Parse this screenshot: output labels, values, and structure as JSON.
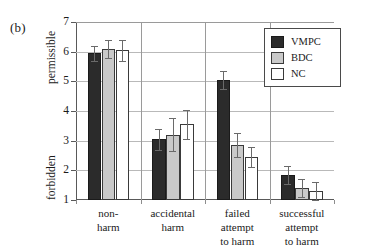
{
  "panel": {
    "letter": "(b)"
  },
  "axis": {
    "y_top_label": "permissible",
    "y_bottom_label": "forbidden",
    "ticks": [
      "7",
      "6",
      "5",
      "4",
      "3",
      "2",
      "1"
    ]
  },
  "legend": {
    "entries": [
      {
        "label": "VMPC",
        "color": "#2b2b2b"
      },
      {
        "label": "BDC",
        "color": "#c9c9c9"
      },
      {
        "label": "NC",
        "color": "#ffffff"
      }
    ]
  },
  "categories": [
    {
      "lines": [
        "non-",
        "harm"
      ]
    },
    {
      "lines": [
        "accidental",
        "harm"
      ]
    },
    {
      "lines": [
        "failed",
        "attempt",
        "to harm"
      ]
    },
    {
      "lines": [
        "successful",
        "attempt",
        "to harm"
      ]
    }
  ],
  "chart_data": {
    "type": "bar",
    "title": "",
    "xlabel": "",
    "ylabel": "forbidden — permissible",
    "ylim": [
      1,
      7
    ],
    "yticks": [
      1,
      2,
      3,
      4,
      5,
      6,
      7
    ],
    "grid": true,
    "legend_position": "top-right",
    "categories": [
      "non-harm",
      "accidental harm",
      "failed attempt to harm",
      "successful attempt to harm"
    ],
    "series": [
      {
        "name": "VMPC",
        "color": "#2b2b2b",
        "values": [
          5.95,
          3.05,
          5.05,
          1.85
        ],
        "errors": [
          0.25,
          0.35,
          0.3,
          0.3
        ]
      },
      {
        "name": "BDC",
        "color": "#c9c9c9",
        "values": [
          6.1,
          3.2,
          2.85,
          1.4
        ],
        "errors": [
          0.3,
          0.55,
          0.4,
          0.3
        ]
      },
      {
        "name": "NC",
        "color": "#ffffff",
        "values": [
          6.05,
          3.55,
          2.45,
          1.3
        ],
        "errors": [
          0.35,
          0.5,
          0.35,
          0.3
        ]
      }
    ]
  }
}
